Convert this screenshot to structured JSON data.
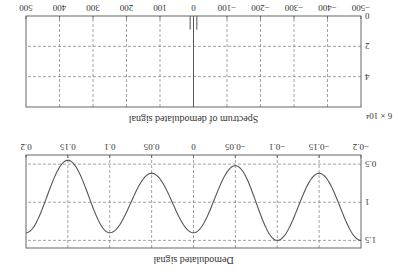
{
  "orientation": "rotated-180",
  "chart_data": [
    {
      "type": "line",
      "title": "Demodulated signal",
      "xlabel": "",
      "ylabel": "",
      "xlim": [
        -0.2,
        0.2
      ],
      "ylim": [
        0.38,
        1.6
      ],
      "xticks": [
        -0.2,
        -0.15,
        -0.1,
        -0.05,
        0,
        0.05,
        0.1,
        0.15,
        0.2
      ],
      "xtick_labels": [
        "−0.2",
        "−0.15",
        "−0.1",
        "−0.05",
        "0",
        "0.05",
        "0.1",
        "0.15",
        "0.2"
      ],
      "yticks": [
        0.5,
        1,
        1.5
      ],
      "ytick_labels": [
        "0.5",
        "1",
        "1.5"
      ],
      "grid": true,
      "series": [
        {
          "name": "demodulated",
          "x": [
            -0.2,
            -0.15,
            -0.1,
            -0.05,
            0,
            0.05,
            0.1,
            0.15,
            0.2
          ],
          "values": [
            1.5,
            0.62,
            1.5,
            0.52,
            1.4,
            0.62,
            1.4,
            0.45,
            1.4
          ]
        }
      ]
    },
    {
      "type": "bar",
      "title": "Spectrum of demodulated signal",
      "xlabel": "",
      "ylabel": "",
      "y_scale_label": "× 10⁴",
      "xlim": [
        -500,
        500
      ],
      "ylim": [
        0,
        6
      ],
      "xticks": [
        -500,
        -400,
        -300,
        -200,
        -100,
        0,
        100,
        200,
        300,
        400,
        500
      ],
      "xtick_labels": [
        "−500",
        "−400",
        "−300",
        "−200",
        "−100",
        "0",
        "100",
        "200",
        "300",
        "400",
        "500"
      ],
      "yticks": [
        0,
        2,
        4,
        6
      ],
      "ytick_labels": [
        "0",
        "2",
        "4",
        "6"
      ],
      "grid": true,
      "series": [
        {
          "name": "spectrum",
          "x": [
            -10,
            0,
            10
          ],
          "values": [
            0.9,
            6.0,
            0.9
          ]
        }
      ]
    }
  ]
}
